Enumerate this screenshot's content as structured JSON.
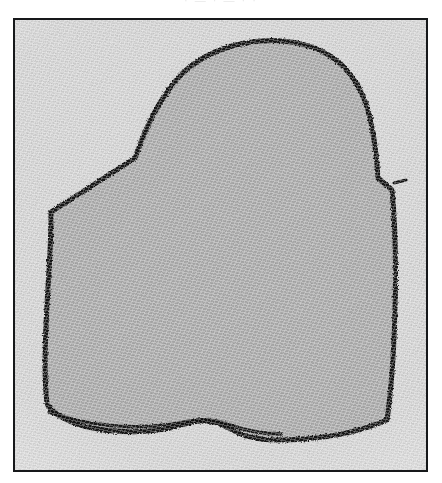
{
  "page": {
    "width": 442,
    "height": 483,
    "background": "#ffffff",
    "header_ghost_text": "· — ·  —  ·  ·",
    "caption": ""
  },
  "plate": {
    "frame_color": "#16181a",
    "frame_width_px": 2,
    "outside_fill": "#e2e2e2",
    "inside_fill": "#b6b6b6",
    "ink_color": "#111111",
    "bounds": {
      "x": 13,
      "y": 18,
      "width": 415,
      "height": 454
    }
  },
  "figure": {
    "name": "hand-drawn closed outline",
    "stroke_color": "#121212",
    "stroke_width_px": 5,
    "fill_color": "#b6b6b6",
    "outline_path": "M 32 384 C 28 350 31 300 34 250 C 36 218 36 200 36 192 L 120 138 C 130 110 142 82 163 58 C 196 22 256 12 300 28 C 330 40 348 66 355 98 C 360 120 362 140 363 158 L 377 170 C 380 200 381 250 380 290 C 379 330 376 372 372 400 C 340 414 300 420 262 420 C 240 420 226 416 214 408 C 200 400 186 398 170 404 C 140 414 100 414 68 406 C 50 400 38 394 32 384 Z",
    "overlap_path": "M 34 392 C 70 406 120 410 158 404 C 180 400 196 398 212 404 C 228 410 244 414 266 414",
    "tail_spike": {
      "x": 379,
      "y": 163,
      "length": 12
    }
  },
  "colors": {
    "paper_light": "#e2e2e2",
    "paper_dark": "#b6b6b6",
    "ink": "#111111",
    "frame": "#16181a",
    "white": "#ffffff"
  }
}
